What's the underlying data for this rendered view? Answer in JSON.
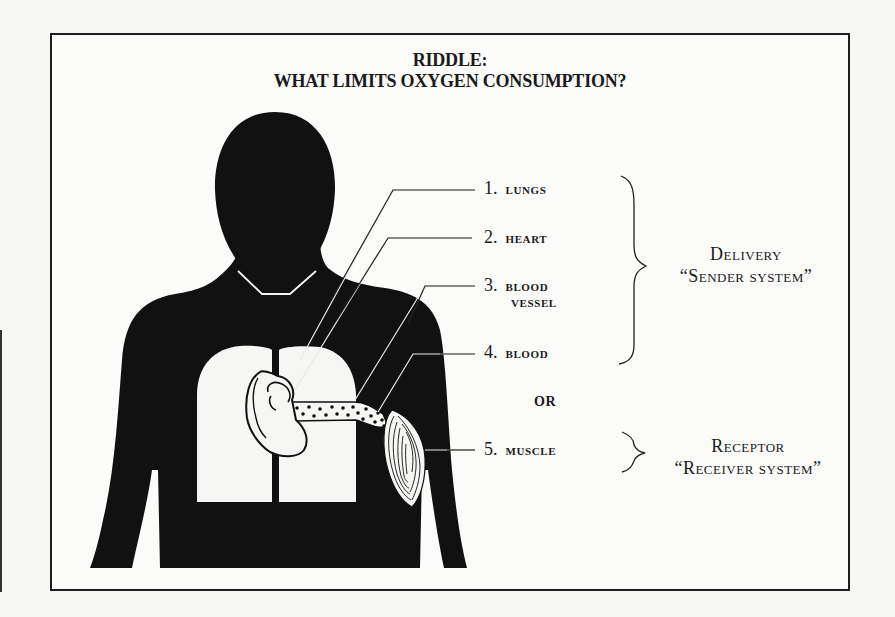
{
  "title": {
    "line1": "RIDDLE:",
    "line2": "WHAT LIMITS OXYGEN CONSUMPTION?"
  },
  "labels": [
    {
      "number": "1.",
      "text": "LUNGS",
      "continuation": ""
    },
    {
      "number": "2.",
      "text": "HEART",
      "continuation": ""
    },
    {
      "number": "3.",
      "text": "BLOOD",
      "continuation": "VESSEL"
    },
    {
      "number": "4.",
      "text": "BLOOD",
      "continuation": ""
    },
    {
      "number": "5.",
      "text": "MUSCLE",
      "continuation": ""
    }
  ],
  "separator": "OR",
  "groups": {
    "delivery": {
      "name": "Delivery",
      "subtitle": "“Sender system”",
      "items": [
        1,
        2,
        3,
        4
      ]
    },
    "receptor": {
      "name": "Receptor",
      "subtitle": "“Receiver system”",
      "items": [
        5
      ]
    }
  },
  "figure": {
    "silhouette_color": "#111111",
    "organ_color": "#f8f8f6",
    "frame_color": "#1e1e1e"
  }
}
